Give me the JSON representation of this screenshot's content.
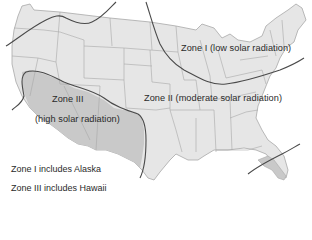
{
  "map": {
    "subject": "United States solar radiation zones",
    "colors": {
      "background": "#ffffff",
      "land_fill": "#e6e6e6",
      "zone3_fill": "#c9c9c9",
      "state_border": "#a8a8a8",
      "zone_boundary": "#4a4a4a",
      "text": "#2a2a2a"
    },
    "zones": [
      {
        "id": "zone-1",
        "label": "Zone I (low solar radiation)"
      },
      {
        "id": "zone-2",
        "label": "Zone II (moderate solar radiation)"
      },
      {
        "id": "zone-3",
        "label_line1": "Zone III",
        "label_line2": "(high solar radiation)"
      }
    ],
    "notes": [
      "Zone I includes Alaska",
      "Zone III includes Hawaii"
    ]
  }
}
